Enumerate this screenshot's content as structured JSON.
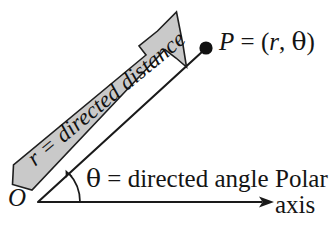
{
  "figure": {
    "background_color": "#ffffff",
    "stroke_color": "#1a1a1a",
    "banner_fill_color": "#c9c9c9",
    "banner_stroke_color": "#1a1a1a",
    "width": 331,
    "height": 240
  },
  "labels": {
    "point": "P = (r, θ)",
    "point_name": "P",
    "point_equals": " = (",
    "point_r": "r",
    "point_comma": ", ",
    "point_theta": "θ",
    "point_close": ")",
    "origin": "O",
    "angle_theta": "θ",
    "angle_rest": " = directed angle",
    "banner": "r = directed distance",
    "banner_r": "r",
    "banner_rest": " = directed distance",
    "axis_line1": "Polar",
    "axis_line2": "axis"
  },
  "geometry": {
    "origin_point": [
      38,
      202
    ],
    "terminal_point": [
      206,
      48
    ],
    "axis_start": [
      38,
      202
    ],
    "axis_end": [
      272,
      202
    ],
    "point_marker_radius": 6.5,
    "ray_angle_degrees": 42,
    "arc_radius": 38
  }
}
